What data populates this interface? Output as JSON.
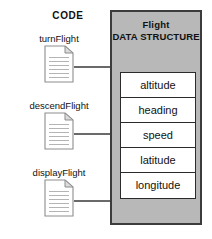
{
  "diagram": {
    "code_column": {
      "heading": "CODE",
      "nodes": [
        {
          "label": "turnFlight",
          "icon": "document-icon"
        },
        {
          "label": "descendFlight",
          "icon": "document-icon"
        },
        {
          "label": "displayFlight",
          "icon": "document-icon"
        }
      ]
    },
    "data_structure": {
      "title_line1": "Flight",
      "title_line2": "DATA STRUCTURE",
      "fields": [
        {
          "name": "altitude"
        },
        {
          "name": "heading"
        },
        {
          "name": "speed"
        },
        {
          "name": "latitude"
        },
        {
          "name": "longitude"
        }
      ]
    },
    "colors": {
      "box_fill": "#b8b8b8",
      "box_border": "#3c3c3c",
      "field_fill": "#ffffff",
      "field_border": "#2b2b2b",
      "connector": "#6a6a6a",
      "text": "#111111",
      "background": "#ffffff"
    }
  }
}
